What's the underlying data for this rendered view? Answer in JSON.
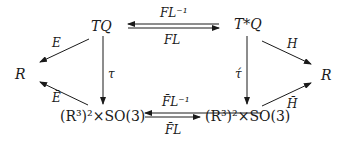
{
  "diagram": {
    "nodes": {
      "tq": "TQ",
      "tstarq": "T*Q",
      "r_left": "R",
      "r_right": "R",
      "bottom_left": "(R³)²×SO(3)",
      "bottom_right": "(R³)²×SO(3)"
    },
    "edges": {
      "fl_inverse": "FL⁻¹",
      "fl": "FL",
      "fl_bar_inverse": "F̄L⁻¹",
      "fl_bar": "F̄L",
      "e": "E",
      "e_bar": "Ē",
      "h": "H",
      "h_bar": "H̄",
      "tau": "τ",
      "tau_acute": "τ́"
    }
  }
}
